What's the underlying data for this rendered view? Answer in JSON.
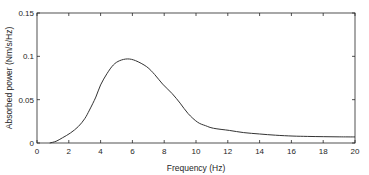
{
  "chart_data": {
    "type": "line",
    "title": "",
    "xlabel": "Frequency (Hz)",
    "ylabel": "Absorbed power (Nm/s/Hz)",
    "xlim": [
      0,
      20
    ],
    "ylim": [
      0,
      0.15
    ],
    "grid": false,
    "legend": null,
    "x_ticks": [
      0,
      2,
      4,
      6,
      8,
      10,
      12,
      14,
      16,
      18,
      20
    ],
    "x_tick_labels": [
      "0",
      "2",
      "4",
      "6",
      "8",
      "10",
      "12",
      "14",
      "16",
      "18",
      "20"
    ],
    "y_ticks": [
      0,
      0.05,
      0.1,
      0.15
    ],
    "y_tick_labels": [
      "0",
      "0.05",
      "0.1",
      "0.15"
    ],
    "series": [
      {
        "name": "Absorbed power",
        "color": "#333333",
        "x": [
          0.8,
          1.2,
          1.6,
          2.1,
          2.6,
          3.0,
          3.3,
          3.7,
          4.0,
          4.4,
          4.8,
          5.2,
          5.7,
          6.2,
          6.9,
          7.4,
          7.9,
          8.5,
          9.0,
          9.5,
          10.1,
          10.6,
          11.1,
          12.1,
          13.0,
          14.0,
          15.0,
          16.1,
          17.0,
          18.0,
          19.0,
          20.0
        ],
        "values": [
          0.0,
          0.002,
          0.006,
          0.0115,
          0.019,
          0.028,
          0.038,
          0.053,
          0.067,
          0.08,
          0.09,
          0.095,
          0.097,
          0.095,
          0.088,
          0.079,
          0.068,
          0.057,
          0.046,
          0.034,
          0.024,
          0.02,
          0.017,
          0.0145,
          0.012,
          0.0104,
          0.009,
          0.008,
          0.0076,
          0.0073,
          0.0071,
          0.007
        ]
      }
    ]
  }
}
